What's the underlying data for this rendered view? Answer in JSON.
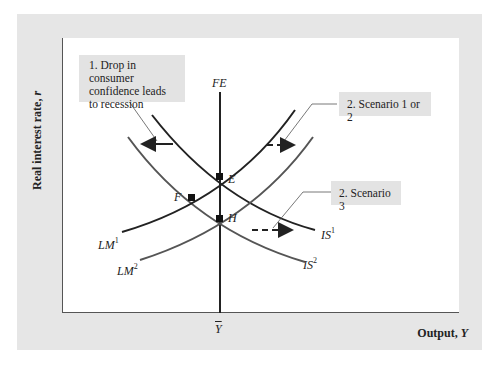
{
  "figure": {
    "y_axis_label": "Real interest rate,",
    "y_axis_var": "r",
    "x_axis_label": "Output,",
    "x_axis_var": "Y",
    "x_tick_label": "Y",
    "curves": {
      "fe": "FE",
      "lm1_base": "LM",
      "lm1_sup": "1",
      "lm2_base": "LM",
      "lm2_sup": "2",
      "is1_base": "IS",
      "is1_sup": "1",
      "is2_base": "IS",
      "is2_sup": "2"
    },
    "points": {
      "e": "E",
      "f": "F",
      "h": "H"
    },
    "callouts": {
      "step1": "1. Drop in consumer confidence leads to recession",
      "scenario12": "2. Scenario 1 or 2",
      "scenario3": "2. Scenario 3"
    },
    "colors": {
      "panel": "#e6e6e6",
      "callout_bg": "#e3e3e3",
      "curve_dark": "#222222",
      "curve_gray": "#555555"
    }
  }
}
